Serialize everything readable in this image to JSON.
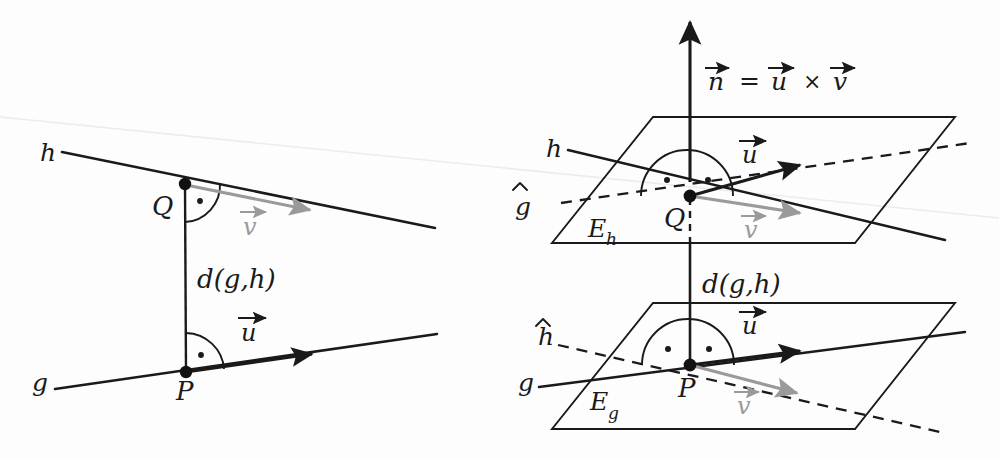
{
  "figure": {
    "background_color": "#fdfdfd",
    "ink_color": "#1a1a1a",
    "gray_vector_color": "#9a9a9a",
    "scan_artifact_color": "#ebebeb"
  },
  "left_panel": {
    "name": "parallel-lines-view",
    "labels": {
      "line_h": "h",
      "line_g": "g",
      "point_Q": "Q",
      "point_P": "P",
      "vector_v": "v",
      "vector_u": "u",
      "distance": "d(g,h)"
    },
    "right_angle_markers": [
      {
        "at": "Q",
        "dots": 1
      },
      {
        "at": "P",
        "dots": 1
      }
    ]
  },
  "right_panel": {
    "name": "planes-view",
    "labels": {
      "normal_formula_n": "n",
      "normal_formula_equals": "=",
      "normal_formula_u": "u",
      "normal_formula_times": "×",
      "normal_formula_v": "v",
      "line_h": "h",
      "line_g": "g",
      "line_g_hat": "g",
      "line_h_hat": "h",
      "point_Q": "Q",
      "point_P": "P",
      "plane_upper": "E",
      "plane_upper_sub": "h",
      "plane_lower": "E",
      "plane_lower_sub": "g",
      "vector_u_upper": "u",
      "vector_v_upper": "v",
      "vector_u_lower": "u",
      "vector_v_lower": "v",
      "distance": "d(g,h)"
    },
    "right_angle_markers": [
      {
        "at": "Q",
        "dots": 2
      },
      {
        "at": "P",
        "dots": 2
      }
    ]
  }
}
